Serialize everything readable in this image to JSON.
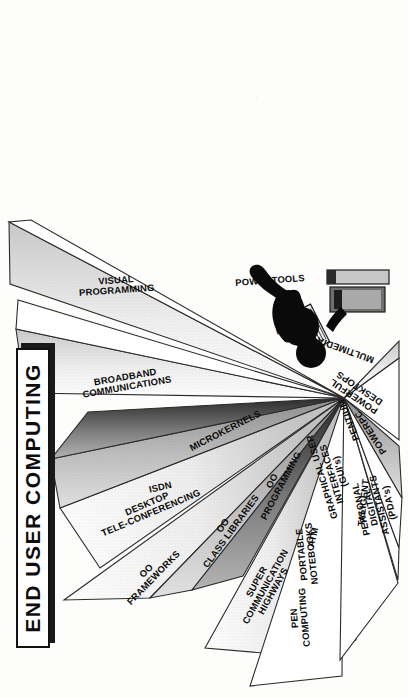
{
  "slide": {
    "title": "END USER COMPUTING",
    "background_color": "#fdfdfc",
    "ink_color": "#0b0b0b"
  },
  "center_graphic": {
    "name": "person-at-computer-workstation",
    "description": "black silhouette of a seated person using a desktop computer with monitor and keyboard"
  },
  "wedges": [
    {
      "id": "oo-frameworks",
      "label_lines": [
        "OO",
        "FRAMEWORKS"
      ],
      "label": "OO FRAMEWORKS",
      "fill": "light"
    },
    {
      "id": "oo-class-libraries",
      "label_lines": [
        "OO",
        "CLASS LIBRARIES"
      ],
      "label": "OO CLASS LIBRARIES",
      "fill": "medium"
    },
    {
      "id": "oo-programming",
      "label_lines": [
        "OO",
        "PROGRAMMING"
      ],
      "label": "OO PROGRAMMING",
      "fill": "dark"
    },
    {
      "id": "desktop-tele-conferencing",
      "label_lines": [
        "DESKTOP",
        "TELE-CONFERENCING"
      ],
      "label": "DESKTOP TELE-CONFERENCING",
      "fill": "light"
    },
    {
      "id": "isdn",
      "label_lines": [
        "ISDN"
      ],
      "label": "ISDN",
      "fill": "medium"
    },
    {
      "id": "microkernels",
      "label_lines": [
        "MICROKERNELS"
      ],
      "label": "MICROKERNELS",
      "fill": "dark"
    },
    {
      "id": "broadband-communications",
      "label_lines": [
        "BROADBAND",
        "COMMUNICATIONS"
      ],
      "label": "BROADBAND COMMUNICATIONS",
      "fill": "light"
    },
    {
      "id": "risc",
      "label_lines": [
        "RISC"
      ],
      "label": "RISC",
      "fill": "none"
    },
    {
      "id": "visual-programming",
      "label_lines": [
        "VISUAL",
        "PROGRAMMING"
      ],
      "label": "VISUAL PROGRAMMING",
      "fill": "light"
    },
    {
      "id": "powertools",
      "label_lines": [
        "POWERTOOLS"
      ],
      "label": "POWERTOOLS",
      "fill": "none"
    },
    {
      "id": "super-communication-highways",
      "label_lines": [
        "SUPER",
        "COMMUNICATION",
        "HIGHWAYS"
      ],
      "label": "SUPER COMMUNICATION HIGHWAYS",
      "fill": "light"
    },
    {
      "id": "atm",
      "label_lines": [
        "ATM"
      ],
      "label": "ATM",
      "fill": "medium"
    },
    {
      "id": "taligent",
      "label_lines": [
        "TALIGENT"
      ],
      "label": "TALIGENT",
      "fill": "dark"
    },
    {
      "id": "pen-computing",
      "label_lines": [
        "PEN",
        "COMPUTING"
      ],
      "label": "PEN COMPUTING",
      "fill": "none"
    },
    {
      "id": "portable-notebooks",
      "label_lines": [
        "PORTABLE",
        "NOTEBOOKS"
      ],
      "label": "PORTABLE NOTEBOOKS",
      "fill": "none"
    },
    {
      "id": "graphical-user-interfaces",
      "label_lines": [
        "GRAPHICAL  USER",
        "INTERFACES",
        "(GUI's)"
      ],
      "label": "GRAPHICAL USER INTERFACES (GUI's)",
      "fill": "none"
    },
    {
      "id": "pentium",
      "label_lines": [
        "PENTIUM"
      ],
      "label": "PENTIUM",
      "fill": "none"
    },
    {
      "id": "personal-digital-assistants",
      "label_lines": [
        "PERSONAL",
        "DIGITAL",
        "ASSISTANTS",
        "(PDA's)"
      ],
      "label": "PERSONAL DIGITAL ASSISTANTS (PDA's)",
      "fill": "none"
    },
    {
      "id": "powerpc",
      "label_lines": [
        "POWERPC"
      ],
      "label": "POWERPC",
      "fill": "medium"
    },
    {
      "id": "powerful-desktops",
      "label_lines": [
        "POWERFUL",
        "DESKTOPS"
      ],
      "label": "POWERFUL DESKTOPS",
      "fill": "none"
    },
    {
      "id": "multimedia",
      "label_lines": [
        "MULTIMEDIA"
      ],
      "label": "MULTIMEDIA",
      "fill": "light"
    }
  ],
  "labels": {
    "oo": "OO",
    "frameworks": "FRAMEWORKS",
    "class_libraries": "CLASS LIBRARIES",
    "programming": "PROGRAMMING",
    "desktop": "DESKTOP",
    "tele_conferencing": "TELE-CONFERENCING",
    "isdn": "ISDN",
    "microkernels": "MICROKERNELS",
    "broadband": "BROADBAND",
    "communications": "COMMUNICATIONS",
    "risc": "RISC",
    "visual": "VISUAL",
    "visual_programming": "PROGRAMMING",
    "powertools": "POWERTOOLS",
    "super": "SUPER",
    "communication": "COMMUNICATION",
    "highways": "HIGHWAYS",
    "atm": "ATM",
    "taligent": "TALIGENT",
    "pen": "PEN",
    "computing": "COMPUTING",
    "portable": "PORTABLE",
    "notebooks": "NOTEBOOKS",
    "graphical_user": "GRAPHICAL  USER",
    "interfaces": "INTERFACES",
    "guis": "(GUI's)",
    "pentium": "PENTIUM",
    "personal": "PERSONAL",
    "digital": "DIGITAL",
    "assistants": "ASSISTANTS",
    "pdas": "(PDA's)",
    "powerpc": "POWERPC",
    "powerful": "POWERFUL",
    "desktops": "DESKTOPS",
    "multimedia": "MULTIMEDIA"
  }
}
